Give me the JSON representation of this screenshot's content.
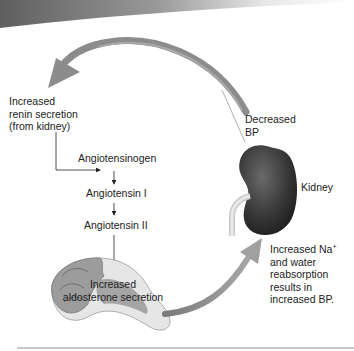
{
  "diagram": {
    "type": "renin-angiotensin-aldosterone system",
    "nodes": {
      "renin": "Increased\nrenin secretion\n(from kidney)",
      "renin_lines": [
        "Increased",
        "renin secretion",
        "(from kidney)"
      ],
      "angiotensinogen": "Angiotensinogen",
      "angiotensin_1": "Angiotensin I",
      "angiotensin_2": "Angiotensin II",
      "aldosterone_lines": [
        "Increased",
        "aldosterone secretion"
      ],
      "decreased_bp_lines": [
        "Decreased",
        "BP"
      ],
      "kidney": "Kidney",
      "result_lines": [
        "Increased Na",
        "and water",
        "reabsorption",
        "results in",
        "increased BP."
      ],
      "na_superscript": "+"
    },
    "colors": {
      "arrow": "#8a8a8a",
      "kidney": "#3c3c3c",
      "adrenal": "#a9a9a9",
      "text": "#222222",
      "banner": "#6e6e6e"
    }
  }
}
